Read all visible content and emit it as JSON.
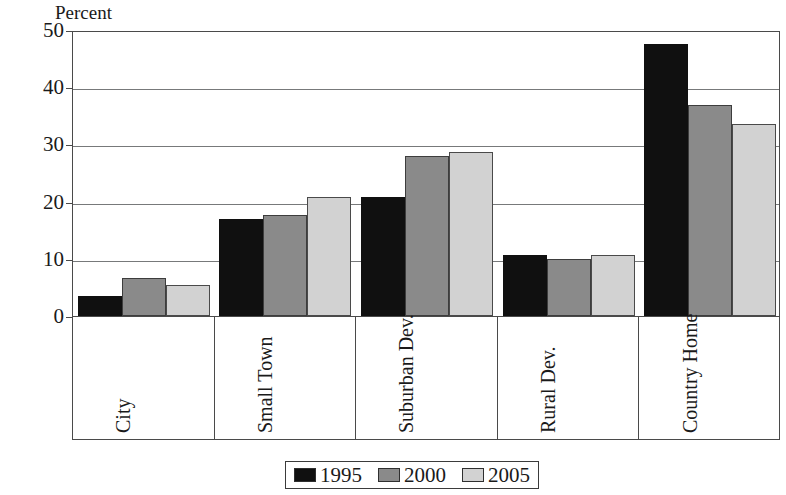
{
  "chart_data": {
    "type": "bar",
    "title": "",
    "ylabel": "Percent",
    "xlabel": "",
    "ylim": [
      0,
      50
    ],
    "ytick_step": 10,
    "yticks": [
      "0",
      "10",
      "20",
      "30",
      "40",
      "50"
    ],
    "grid": true,
    "legend_position": "bottom",
    "categories": [
      "City",
      "Small Town",
      "Suburban Dev.",
      "Rural Dev.",
      "Country Home"
    ],
    "series": [
      {
        "name": "1995",
        "color": "#101010",
        "values": [
          3.5,
          17.0,
          20.8,
          10.6,
          47.5
        ]
      },
      {
        "name": "2000",
        "color": "#8a8a8a",
        "values": [
          6.7,
          17.6,
          28.0,
          9.9,
          36.9
        ]
      },
      {
        "name": "2005",
        "color": "#d2d2d2",
        "values": [
          5.5,
          20.8,
          28.6,
          10.7,
          33.6
        ]
      }
    ]
  },
  "axis": {
    "y_title": "Percent"
  },
  "legend": {
    "items": [
      {
        "label": "1995"
      },
      {
        "label": "2000"
      },
      {
        "label": "2005"
      }
    ]
  }
}
